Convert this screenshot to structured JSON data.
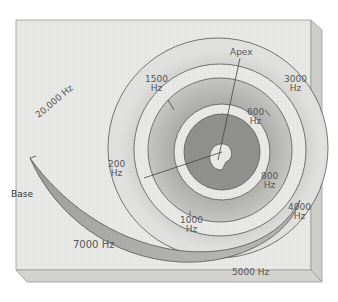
{
  "diagram": {
    "colors": {
      "board_top": "#e6e6e4",
      "board_side": "#cfcfcc",
      "board_bottom": "#d2d2cf",
      "spiral_dark": "#8a8a88",
      "spiral_light": "#d8d8d6",
      "text": "#555555"
    },
    "endpoints": {
      "base": "Base",
      "apex": "Apex"
    },
    "frequency_labels": [
      {
        "id": "f20000",
        "value": "20,000",
        "unit": "Hz",
        "text": "20,000 Hz"
      },
      {
        "id": "f1500",
        "value": "1500",
        "unit": "Hz"
      },
      {
        "id": "f3000",
        "value": "3000",
        "unit": "Hz"
      },
      {
        "id": "f600",
        "value": "600",
        "unit": "Hz"
      },
      {
        "id": "f200",
        "value": "200",
        "unit": "Hz"
      },
      {
        "id": "f800",
        "value": "800",
        "unit": "Hz"
      },
      {
        "id": "f1000",
        "value": "1000",
        "unit": "Hz"
      },
      {
        "id": "f4000",
        "value": "4000",
        "unit": "Hz"
      },
      {
        "id": "f7000",
        "value": "7000",
        "unit": "Hz",
        "text": "7000 Hz"
      },
      {
        "id": "f5000",
        "value": "5000",
        "unit": "Hz",
        "text": "5000 Hz"
      }
    ]
  }
}
